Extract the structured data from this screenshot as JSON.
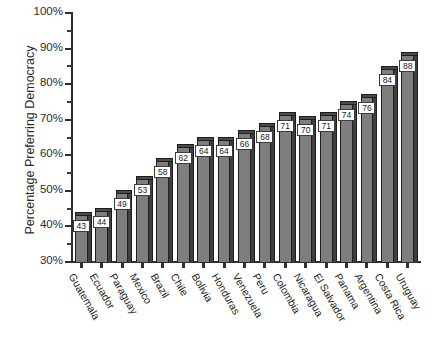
{
  "chart_data": {
    "type": "bar",
    "title": "",
    "subtitle": "",
    "xlabel": "",
    "ylabel": "Percentage Preferring Democracy",
    "ylim": [
      30,
      100
    ],
    "ytick_labels": [
      "30%",
      "40%",
      "50%",
      "60%",
      "70%",
      "80%",
      "90%",
      "100%"
    ],
    "ytick_values": [
      30,
      40,
      50,
      60,
      70,
      80,
      90,
      100
    ],
    "minor_tick_step": 5,
    "grid": false,
    "legend": null,
    "bar_style": "3d-column",
    "value_labels_shown": true,
    "categories": [
      "Guatemala",
      "Ecuador",
      "Paraguay",
      "Mexico",
      "Brazil",
      "Chile",
      "Bolivia",
      "Honduras",
      "Venezuela",
      "Peru",
      "Colombia",
      "Nicaragua",
      "El Salvador",
      "Panama",
      "Argentina",
      "Costa Rica",
      "Uruguay"
    ],
    "values": [
      43,
      44,
      49,
      53,
      58,
      62,
      64,
      64,
      66,
      68,
      71,
      70,
      71,
      74,
      76,
      84,
      88
    ],
    "value_label_text": [
      "43",
      "44",
      "49",
      "53",
      "58",
      "62",
      "64",
      "64",
      "66",
      "68",
      "71",
      "70",
      "71",
      "74",
      "76",
      "84",
      "88"
    ]
  },
  "colors": {
    "bar_face": "#7e7e7e",
    "bar_top": "#4a4a4a",
    "bar_side": "#3f3f3f",
    "axis": "#2f2f2f",
    "text": "#2b2b2b",
    "label_box_bg": "#ffffff",
    "background": "#ffffff"
  }
}
